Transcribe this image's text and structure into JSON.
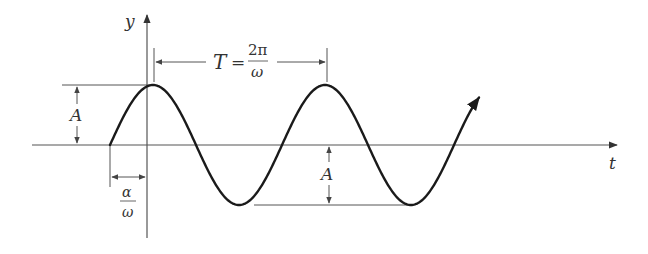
{
  "diagram": {
    "type": "sinusoid-annotated",
    "axes": {
      "x_label": "t",
      "y_label": "y"
    },
    "period_annotation": {
      "symbol": "T",
      "equals": "=",
      "numerator": "2π",
      "denominator": "ω"
    },
    "amplitude_left_label": "A",
    "amplitude_right_label": "A",
    "phase_shift_annotation": {
      "numerator": "α",
      "denominator": "ω"
    },
    "colors": {
      "curve": "#1a1a1a",
      "axis": "#444444",
      "annotation": "#555555",
      "background": "#ffffff"
    }
  }
}
